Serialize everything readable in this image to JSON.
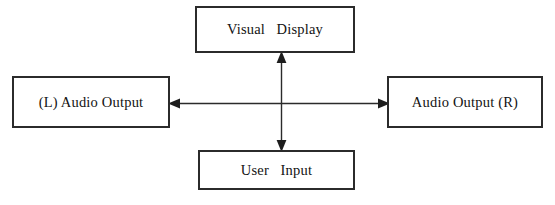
{
  "diagram": {
    "background_color": "#ffffff",
    "border_color": "#2b2b2b",
    "text_color": "#121212",
    "nodes": [
      {
        "id": "visual-display",
        "label": "Visual   Display",
        "position": "top"
      },
      {
        "id": "audio-output-left",
        "label": "(L) Audio Output",
        "position": "left"
      },
      {
        "id": "audio-output-right",
        "label": "Audio Output (R)",
        "position": "right"
      },
      {
        "id": "user-input",
        "label": "User   Input",
        "position": "bottom"
      }
    ],
    "connectors": [
      {
        "id": "horizontal",
        "from": "audio-output-left",
        "to": "audio-output-right",
        "arrow": "double",
        "orientation": "horizontal"
      },
      {
        "id": "vertical",
        "from": "visual-display",
        "to": "user-input",
        "arrow": "double",
        "orientation": "vertical"
      }
    ]
  }
}
